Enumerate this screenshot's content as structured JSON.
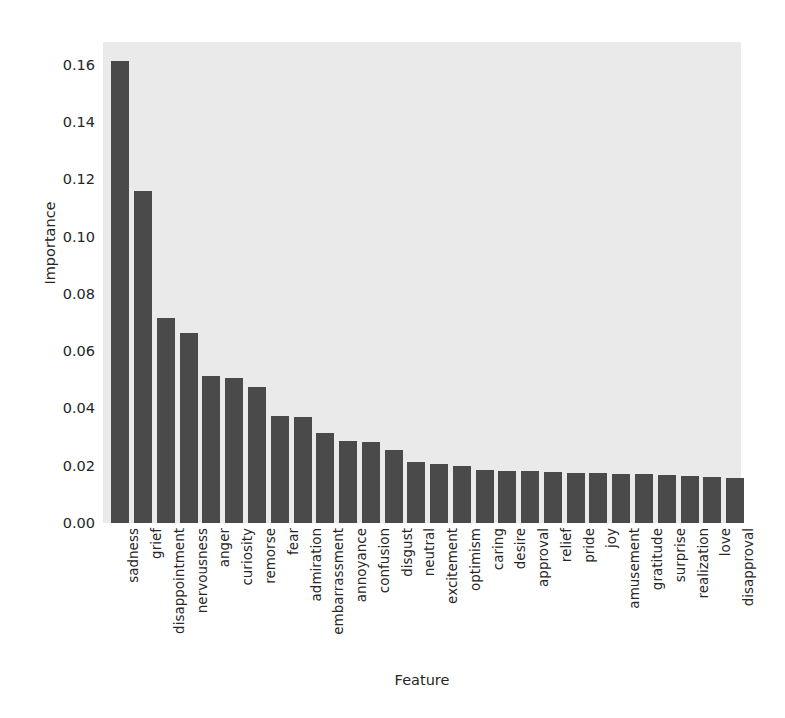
{
  "chart_data": {
    "type": "bar",
    "title": "",
    "xlabel": "Feature",
    "ylabel": "Importance",
    "ylim": [
      0.0,
      0.168
    ],
    "yticks": [
      "0.00",
      "0.02",
      "0.04",
      "0.06",
      "0.08",
      "0.10",
      "0.12",
      "0.14",
      "0.16"
    ],
    "ytick_values": [
      0.0,
      0.02,
      0.04,
      0.06,
      0.08,
      0.1,
      0.12,
      0.14,
      0.16
    ],
    "grid": false,
    "legend": null,
    "bar_color": "#4a4a4a",
    "plot_background": "#eaeaea",
    "figure_background": "#ffffff",
    "categories": [
      "sadness",
      "grief",
      "disappointment",
      "nervousness",
      "anger",
      "curiosity",
      "remorse",
      "fear",
      "admiration",
      "embarrassment",
      "annoyance",
      "confusion",
      "disgust",
      "neutral",
      "excitement",
      "optimism",
      "caring",
      "desire",
      "approval",
      "relief",
      "pride",
      "joy",
      "amusement",
      "gratitude",
      "surprise",
      "realization",
      "love",
      "disapproval"
    ],
    "values": [
      0.1615,
      0.116,
      0.0715,
      0.0665,
      0.0515,
      0.0505,
      0.0475,
      0.0375,
      0.0372,
      0.0315,
      0.0285,
      0.0283,
      0.0255,
      0.0212,
      0.0205,
      0.02,
      0.0186,
      0.0183,
      0.018,
      0.0178,
      0.0176,
      0.0174,
      0.0172,
      0.017,
      0.0166,
      0.0163,
      0.016,
      0.0158
    ]
  }
}
